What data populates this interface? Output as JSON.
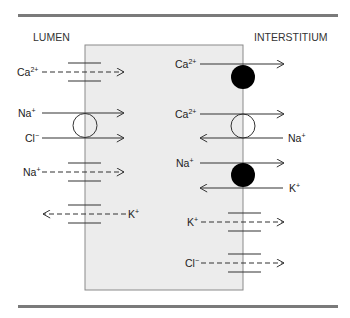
{
  "diagram": {
    "type": "membrane-transport",
    "compartments": {
      "left": "LUMEN",
      "right": "INTERSTITIUM"
    },
    "colors": {
      "cell_fill": "#ececec",
      "cell_border": "#8a8a8a",
      "rule": "#7a7a7a",
      "pump": "#000000",
      "line": "#333333"
    },
    "apical": [
      {
        "id": "ca-channel",
        "kind": "channel",
        "ion": "Ca",
        "charge": "2+",
        "direction": "in",
        "style": "dashed"
      },
      {
        "id": "na-cl-cotransporter-na",
        "kind": "cotransporter",
        "ion": "Na",
        "charge": "+",
        "direction": "in",
        "style": "solid"
      },
      {
        "id": "na-cl-cotransporter-cl",
        "kind": "cotransporter",
        "ion": "Cl",
        "charge": "−",
        "direction": "in",
        "style": "solid"
      },
      {
        "id": "na-channel",
        "kind": "channel",
        "ion": "Na",
        "charge": "+",
        "direction": "in",
        "style": "dashed"
      },
      {
        "id": "k-channel",
        "kind": "channel",
        "ion": "K",
        "charge": "+",
        "direction": "out",
        "style": "dashed"
      }
    ],
    "basolateral": [
      {
        "id": "ca-atpase",
        "kind": "pump",
        "ion": "Ca",
        "charge": "2+",
        "direction": "out",
        "style": "solid"
      },
      {
        "id": "na-ca-exchanger-ca",
        "kind": "exchanger",
        "ion": "Ca",
        "charge": "2+",
        "direction": "out",
        "style": "solid"
      },
      {
        "id": "na-ca-exchanger-na",
        "kind": "exchanger",
        "ion": "Na",
        "charge": "+",
        "direction": "in",
        "style": "solid"
      },
      {
        "id": "na-k-atpase-na",
        "kind": "pump",
        "ion": "Na",
        "charge": "+",
        "direction": "out",
        "style": "solid"
      },
      {
        "id": "na-k-atpase-k",
        "kind": "pump",
        "ion": "K",
        "charge": "+",
        "direction": "in",
        "style": "solid"
      },
      {
        "id": "k-channel-baso",
        "kind": "channel",
        "ion": "K",
        "charge": "+",
        "direction": "out",
        "style": "dashed"
      },
      {
        "id": "cl-channel-baso",
        "kind": "channel",
        "ion": "Cl",
        "charge": "−",
        "direction": "out",
        "style": "dashed"
      }
    ]
  }
}
